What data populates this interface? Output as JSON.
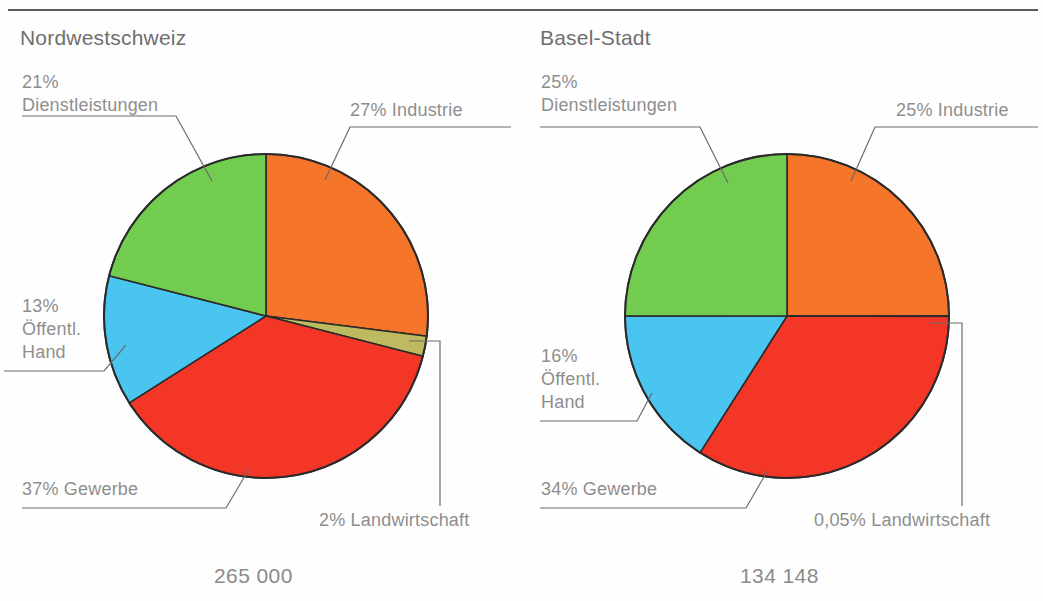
{
  "page": {
    "background": "#fefefe",
    "rule_color": "#5a5a5a",
    "text_color": "#8e8e8e"
  },
  "palette": {
    "industrie": "#F5762B",
    "landwirtschaft": "#BDBA5F",
    "gewerbe": "#F43627",
    "oeffentliche_hand": "#49C5F0",
    "dienstleistungen": "#72CC50",
    "outline": "#2b2b2b",
    "leader": "#6b6b6b"
  },
  "charts": [
    {
      "title": "Nordwestschweiz",
      "total": "265 000",
      "labels": {
        "dienstleistungen": "21%\nDienstleistungen",
        "industrie": "27% Industrie",
        "oeffentliche_hand": "13%\nÖffentl.\nHand",
        "gewerbe": "37% Gewerbe",
        "landwirtschaft": "2% Landwirtschaft"
      }
    },
    {
      "title": "Basel-Stadt",
      "total": "134 148",
      "labels": {
        "dienstleistungen": "25%\nDienstleistungen",
        "industrie": "25% Industrie",
        "oeffentliche_hand": "16%\nÖffentl.\nHand",
        "gewerbe": "34% Gewerbe",
        "landwirtschaft": "0,05% Landwirtschaft"
      }
    }
  ],
  "chart_data": [
    {
      "type": "pie",
      "title": "Nordwestschweiz",
      "subtitle": "265 000",
      "total_value": 265000,
      "unit": "Beschäftigte",
      "categories": [
        "Industrie",
        "Landwirtschaft",
        "Gewerbe",
        "Öffentl. Hand",
        "Dienstleistungen"
      ],
      "values": [
        27,
        2,
        37,
        13,
        21
      ],
      "value_labels": [
        "27% Industrie",
        "2% Landwirtschaft",
        "37% Gewerbe",
        "13% Öffentl. Hand",
        "21% Dienstleistungen"
      ],
      "colors": [
        "#F5762B",
        "#BDBA5F",
        "#F43627",
        "#49C5F0",
        "#72CC50"
      ],
      "start_angle_deg": 0,
      "direction": "clockwise",
      "legend": "none",
      "grid": false
    },
    {
      "type": "pie",
      "title": "Basel-Stadt",
      "subtitle": "134 148",
      "total_value": 134148,
      "unit": "Beschäftigte",
      "categories": [
        "Industrie",
        "Landwirtschaft",
        "Gewerbe",
        "Öffentl. Hand",
        "Dienstleistungen"
      ],
      "values": [
        25,
        0.05,
        34,
        16,
        25
      ],
      "value_labels": [
        "25% Industrie",
        "0,05% Landwirtschaft",
        "34% Gewerbe",
        "16% Öffentl. Hand",
        "25% Dienstleistungen"
      ],
      "colors": [
        "#F5762B",
        "#BDBA5F",
        "#F43627",
        "#49C5F0",
        "#72CC50"
      ],
      "start_angle_deg": 0,
      "direction": "clockwise",
      "legend": "none",
      "grid": false
    }
  ]
}
